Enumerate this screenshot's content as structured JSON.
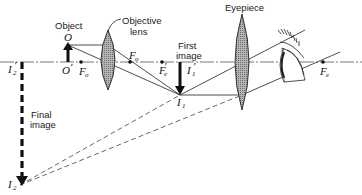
{
  "diagram": {
    "labels": {
      "object": "Object",
      "objective_lens_line1": "Objective",
      "objective_lens_line2": "lens",
      "first_image_line1": "First",
      "first_image_line2": "image",
      "eyepiece": "Eyepiece",
      "final_image_line1": "Final",
      "final_image_line2": "image"
    },
    "points": {
      "O": {
        "main": "O",
        "sub": ""
      },
      "O_prime": {
        "main": "O",
        "prime": "′"
      },
      "F_o_left": {
        "main": "F",
        "sub": "o"
      },
      "F_o_right": {
        "main": "F",
        "sub": "o"
      },
      "F_e_prime": {
        "main": "F",
        "sub": "e",
        "prime": "′"
      },
      "F_e": {
        "main": "F",
        "sub": "e"
      },
      "I1": {
        "main": "I",
        "sub": "1"
      },
      "I1_prime": {
        "main": "I",
        "sub": "1",
        "prime": "′"
      },
      "I2": {
        "main": "I",
        "sub": "2"
      },
      "I2_prime": {
        "main": "I",
        "sub": "2",
        "prime": "′"
      }
    },
    "colors": {
      "line": "#222222",
      "axis": "#555555",
      "lens_fill": "#8a8a8a",
      "dashed": "#444444"
    }
  }
}
